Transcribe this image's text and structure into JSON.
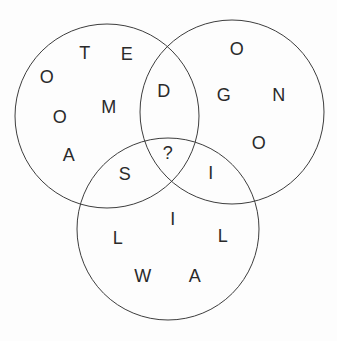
{
  "diagram": {
    "kind": "venn-letter-puzzle",
    "background_color": "#fdfdfd",
    "circle_stroke_color": "#3d3d3d",
    "letter_color": "#2a2a2a",
    "circles": [
      {
        "id": "top-left",
        "cx": 107,
        "cy": 116,
        "r": 92
      },
      {
        "id": "top-right",
        "cx": 232,
        "cy": 112,
        "r": 92
      },
      {
        "id": "bottom",
        "cx": 168,
        "cy": 229,
        "r": 91
      }
    ],
    "letters": [
      {
        "char": "O",
        "x": 47,
        "y": 76,
        "region": "top-left"
      },
      {
        "char": "T",
        "x": 85,
        "y": 52,
        "region": "top-left"
      },
      {
        "char": "E",
        "x": 127,
        "y": 53,
        "region": "top-left"
      },
      {
        "char": "M",
        "x": 109,
        "y": 106,
        "region": "top-left"
      },
      {
        "char": "O",
        "x": 60,
        "y": 116,
        "region": "top-left"
      },
      {
        "char": "A",
        "x": 69,
        "y": 154,
        "region": "top-left"
      },
      {
        "char": "D",
        "x": 164,
        "y": 90,
        "region": "top-left-top-right"
      },
      {
        "char": "O",
        "x": 237,
        "y": 48,
        "region": "top-right"
      },
      {
        "char": "G",
        "x": 224,
        "y": 94,
        "region": "top-right"
      },
      {
        "char": "N",
        "x": 279,
        "y": 94,
        "region": "top-right"
      },
      {
        "char": "O",
        "x": 259,
        "y": 142,
        "region": "top-right"
      },
      {
        "char": "?",
        "x": 168,
        "y": 152,
        "region": "center"
      },
      {
        "char": "S",
        "x": 125,
        "y": 173,
        "region": "top-left-bottom"
      },
      {
        "char": "I",
        "x": 211,
        "y": 172,
        "region": "top-right-bottom"
      },
      {
        "char": "I",
        "x": 173,
        "y": 218,
        "region": "bottom"
      },
      {
        "char": "L",
        "x": 118,
        "y": 237,
        "region": "bottom"
      },
      {
        "char": "L",
        "x": 223,
        "y": 235,
        "region": "bottom"
      },
      {
        "char": "W",
        "x": 143,
        "y": 275,
        "region": "bottom"
      },
      {
        "char": "A",
        "x": 195,
        "y": 275,
        "region": "bottom"
      }
    ]
  }
}
